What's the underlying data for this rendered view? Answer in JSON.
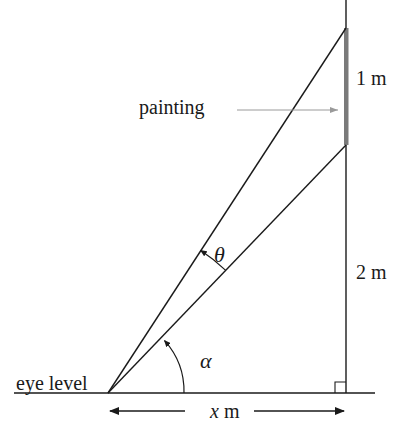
{
  "diagram": {
    "title": "",
    "labels": {
      "painting": "painting",
      "eye_level": "eye level",
      "top_length": "1 m",
      "bottom_height": "2 m",
      "angle_theta": "θ",
      "angle_alpha": "α",
      "distance_var": "x",
      "distance_unit": "m"
    },
    "colors": {
      "line": "#1a1a1a",
      "painting_bar": "#7a7a7a",
      "pointer_arrow": "#9a9a9a"
    },
    "geometry": {
      "eye_point": [
        108,
        393
      ],
      "wall_x": 346,
      "painting_top_y": 28,
      "painting_bottom_y": 145,
      "ground_y": 393,
      "ground_x_range": [
        14,
        375
      ],
      "distance_arrow_y": 411
    }
  }
}
